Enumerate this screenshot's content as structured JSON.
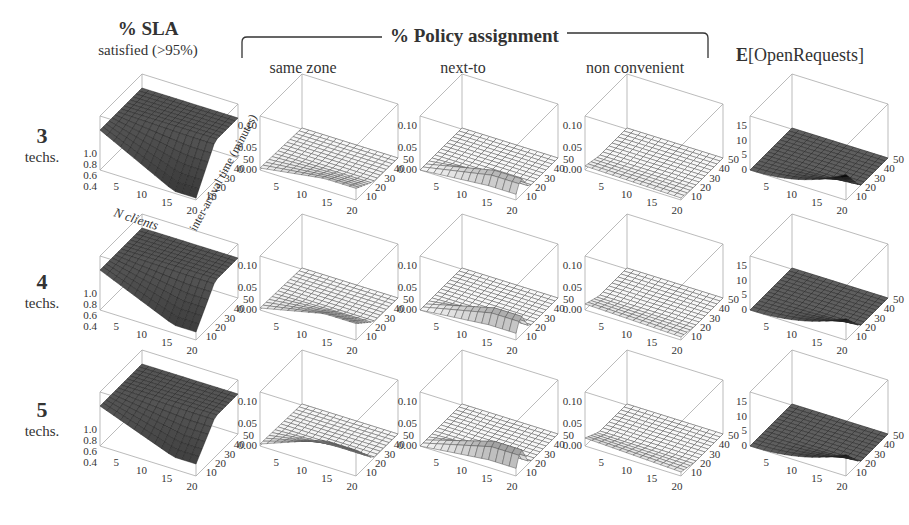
{
  "figure": {
    "sla_header": {
      "title": "% SLA",
      "subtitle": "satisfied (>95%)"
    },
    "policy_header": {
      "title": "% Policy assignment"
    },
    "policy_columns": [
      "same zone",
      "next-to",
      "non convenient"
    ],
    "open_header": {
      "bold": "E",
      "rest": "[OpenRequests]"
    },
    "rows": [
      {
        "num": "3",
        "label": "techs."
      },
      {
        "num": "4",
        "label": "techs."
      },
      {
        "num": "5",
        "label": "techs."
      }
    ],
    "axis_labels": {
      "x": "N clients",
      "y": "inter-arrival time (minutes)"
    }
  },
  "chart_data": {
    "type": "surface3d-grid",
    "rows": [
      "3 techs.",
      "4 techs.",
      "5 techs."
    ],
    "columns": [
      "% SLA satisfied (>95%)",
      "same zone",
      "next-to",
      "non convenient",
      "E[OpenRequests]"
    ],
    "x_axis": {
      "label": "N clients",
      "ticks": [
        5,
        10,
        15,
        20
      ],
      "range": [
        1,
        20
      ]
    },
    "y_axis": {
      "label": "inter-arrival time (minutes)",
      "ticks": [
        10,
        20,
        30,
        40,
        50
      ],
      "range": [
        5,
        50
      ]
    },
    "z_axes": {
      "sla": {
        "ticks": [
          "0.4",
          "0.6",
          "0.8",
          "1.0"
        ],
        "range": [
          0.4,
          1.0
        ]
      },
      "policy": {
        "ticks": [
          "0.00",
          "0.05",
          "0.10"
        ],
        "range": [
          0,
          0.1
        ]
      },
      "open": {
        "ticks": [
          "0",
          "5",
          "10",
          "15"
        ],
        "range": [
          0,
          15
        ]
      }
    },
    "panels": [
      [
        {
          "col": "sla",
          "shape": "drop",
          "min": 0.4,
          "max": 1.0,
          "drop_strength": 0.95,
          "shade": "dark"
        },
        {
          "col": "policy",
          "shape": "bump",
          "peak": 0.02,
          "shade": "light"
        },
        {
          "col": "policy",
          "shape": "ridge",
          "peak": 0.03,
          "shade": "light"
        },
        {
          "col": "policy",
          "shape": "flat",
          "peak": 0.01,
          "shade": "light"
        },
        {
          "col": "open",
          "shape": "spike",
          "peak": 6,
          "shade": "dark"
        }
      ],
      [
        {
          "col": "sla",
          "shape": "drop",
          "min": 0.4,
          "max": 1.0,
          "drop_strength": 0.8,
          "shade": "dark"
        },
        {
          "col": "policy",
          "shape": "bump",
          "peak": 0.03,
          "shade": "light"
        },
        {
          "col": "policy",
          "shape": "ridge",
          "peak": 0.035,
          "shade": "light"
        },
        {
          "col": "policy",
          "shape": "flat",
          "peak": 0.015,
          "shade": "light"
        },
        {
          "col": "open",
          "shape": "spike",
          "peak": 5,
          "shade": "dark"
        }
      ],
      [
        {
          "col": "sla",
          "shape": "drop",
          "min": 0.4,
          "max": 1.0,
          "drop_strength": 0.7,
          "shade": "dark"
        },
        {
          "col": "policy",
          "shape": "bump",
          "peak": 0.05,
          "shade": "light"
        },
        {
          "col": "policy",
          "shape": "ridge",
          "peak": 0.04,
          "shade": "light"
        },
        {
          "col": "policy",
          "shape": "flat",
          "peak": 0.02,
          "shade": "light"
        },
        {
          "col": "open",
          "shape": "spike",
          "peak": 5,
          "shade": "dark"
        }
      ]
    ],
    "grid": true,
    "legend": "none"
  }
}
